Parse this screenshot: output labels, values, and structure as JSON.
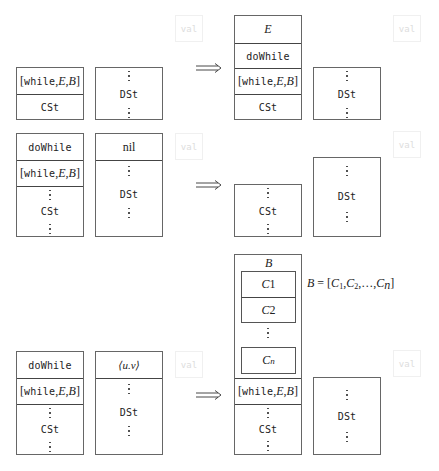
{
  "rows": [
    {
      "before": {
        "control_stack": [
          "[while,E,B]",
          "CSt"
        ],
        "data_stack": [
          "DSt"
        ],
        "val_label": "val"
      },
      "after": {
        "control_stack": [
          "E",
          "doWhile",
          "[while,E,B]",
          "CSt"
        ],
        "data_stack": [
          "DSt"
        ],
        "val_label": "val"
      }
    },
    {
      "before": {
        "control_stack": [
          "doWhile",
          "[while,E,B]",
          "CSt"
        ],
        "data_stack": [
          "nil",
          "DSt"
        ],
        "val_label": "val"
      },
      "after": {
        "control_stack": [
          "CSt"
        ],
        "data_stack": [
          "DSt"
        ],
        "val_label": "val"
      }
    },
    {
      "before": {
        "control_stack": [
          "doWhile",
          "[while,E,B]",
          "CSt"
        ],
        "data_stack": [
          "⟨u.v⟩",
          "DSt"
        ],
        "val_label": "val"
      },
      "after": {
        "block_label": "B",
        "block_items": [
          "C1",
          "C2",
          "Cn"
        ],
        "control_stack": [
          "[while,E,B]",
          "CSt"
        ],
        "data_stack": [
          "DSt"
        ],
        "val_label": "val",
        "block_definition": "B = [C1, C2, ..., Cn]"
      }
    }
  ],
  "arrow_symbol": "⟹",
  "text": {
    "while_kw": "while",
    "E": "E",
    "B": "B",
    "doWhile": "doWhile",
    "CSt": "CSt",
    "DSt": "DSt",
    "nil": "nil",
    "uv": "⟨u.v⟩",
    "val": "val",
    "C": "C",
    "sub1": "1",
    "sub2": "2",
    "subn": "n",
    "eq_prefix": "B = [",
    "eq_suffix": "]",
    "ellipsis": ",…,"
  }
}
